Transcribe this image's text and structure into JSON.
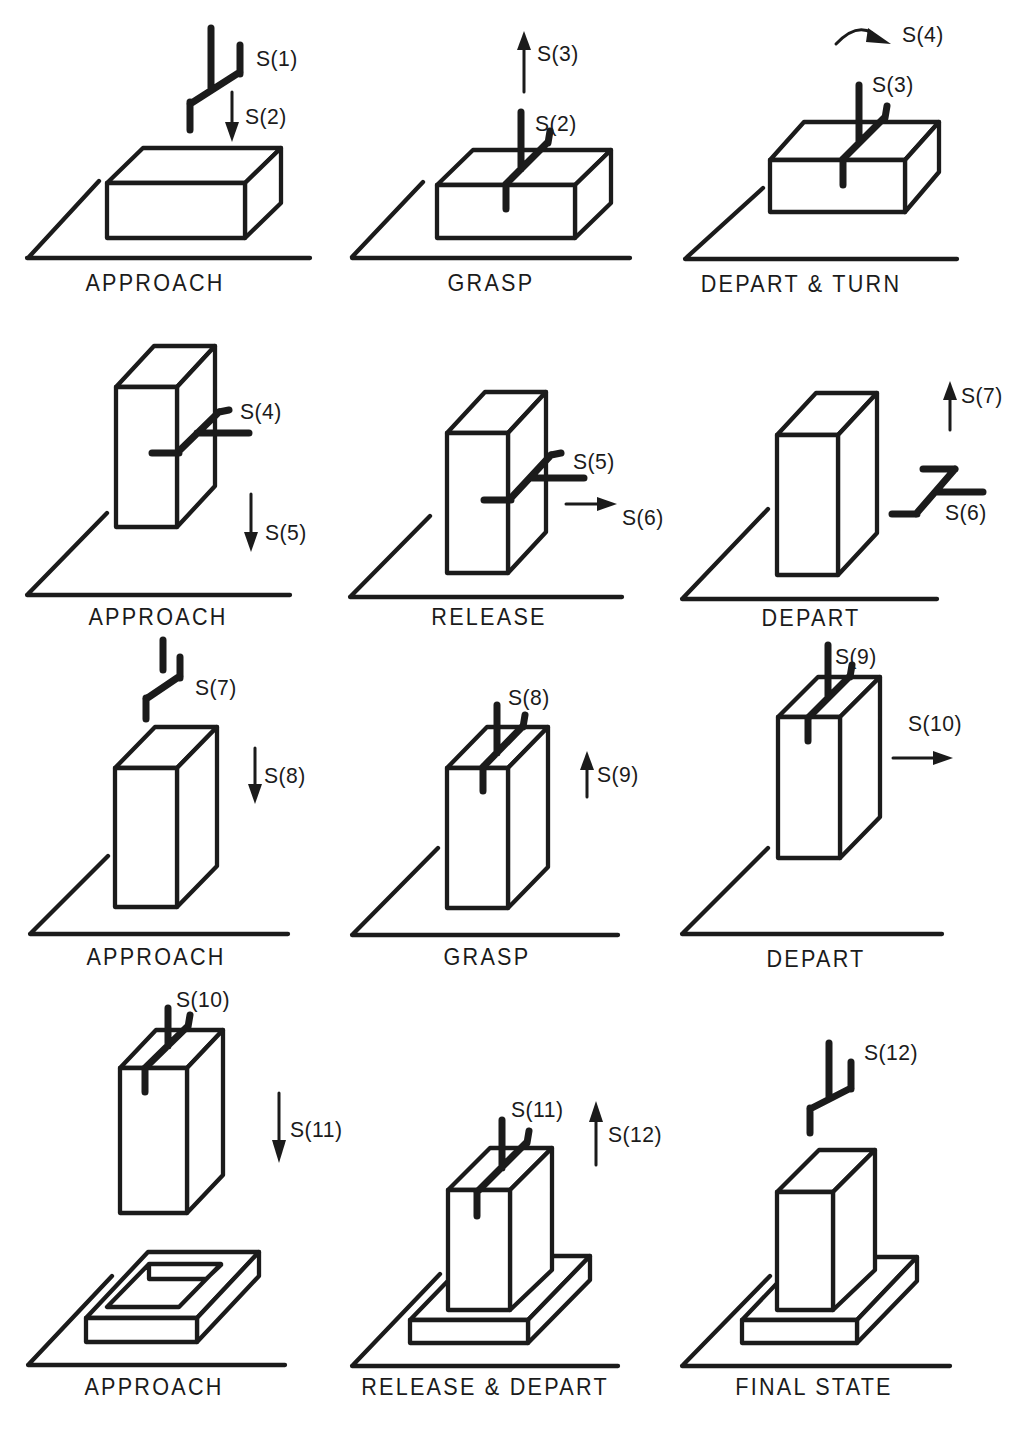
{
  "figure": {
    "background_color": "#ffffff",
    "ink_color": "#1b1b1b",
    "panels": [
      {
        "caption": "APPROACH",
        "gripper": "released-above",
        "motion": "down",
        "labels": [
          "S(1)",
          "S(2)"
        ]
      },
      {
        "caption": "GRASP",
        "gripper": "attached-top",
        "motion": "up",
        "labels": [
          "S(2)",
          "S(3)"
        ]
      },
      {
        "caption": "DEPART & TURN",
        "gripper": "attached-top",
        "motion": "rotate",
        "labels": [
          "S(3)",
          "S(4)"
        ]
      },
      {
        "caption": "APPROACH",
        "gripper": "attached-side",
        "motion": "down",
        "labels": [
          "S(4)",
          "S(5)"
        ]
      },
      {
        "caption": "RELEASE",
        "gripper": "attached-side",
        "motion": "right",
        "labels": [
          "S(5)",
          "S(6)"
        ]
      },
      {
        "caption": "DEPART",
        "gripper": "released-right",
        "motion": "up",
        "labels": [
          "S(6)",
          "S(7)"
        ]
      },
      {
        "caption": "APPROACH",
        "gripper": "released-above",
        "motion": "down",
        "labels": [
          "S(7)",
          "S(8)"
        ]
      },
      {
        "caption": "GRASP",
        "gripper": "attached-top",
        "motion": "up",
        "labels": [
          "S(8)",
          "S(9)"
        ]
      },
      {
        "caption": "DEPART",
        "gripper": "attached-top",
        "motion": "right",
        "labels": [
          "S(9)",
          "S(10)"
        ]
      },
      {
        "caption": "APPROACH",
        "gripper": "attached-top",
        "motion": "down",
        "labels": [
          "S(10)",
          "S(11)"
        ]
      },
      {
        "caption": "RELEASE & DEPART",
        "gripper": "attached-top",
        "motion": "up",
        "labels": [
          "S(11)",
          "S(12)"
        ]
      },
      {
        "caption": "FINAL STATE",
        "gripper": "released-above",
        "motion": null,
        "labels": [
          "S(12)"
        ]
      }
    ]
  }
}
